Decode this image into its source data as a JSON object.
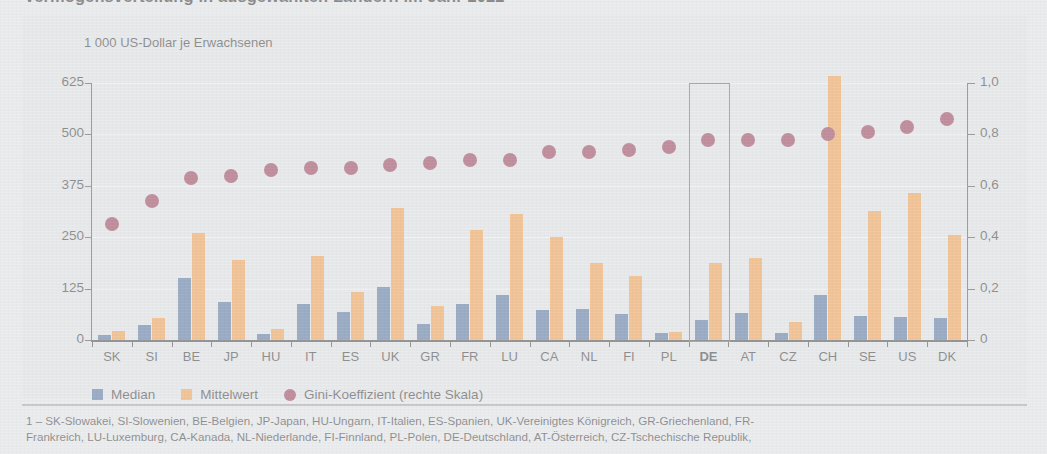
{
  "title": "Vermögensverteilung in ausgewählten Ländern im Jahr 2022",
  "axis_title": "1 000 US-Dollar je Erwachsenen",
  "legend": {
    "median_label": "Median",
    "mean_label": "Mittelwert",
    "gini_label": "Gini-Koeffizient (rechte Skala)"
  },
  "colors": {
    "median": "#3b5f94",
    "mean": "#f79431",
    "gini": "#8d1f3d",
    "highlight_box": "#54576b",
    "panel_background": "#e4e5e7",
    "page_background": "#e9eaec"
  },
  "highlight": {
    "country": "DE",
    "bold_label": true
  },
  "footnote": {
    "line1": "1 – SK-Slowakei, SI-Slowenien, BE-Belgien, JP-Japan, HU-Ungarn, IT-Italien, ES-Spanien, UK-Vereinigtes Königreich, GR-Griechenland, FR-",
    "line2": "Frankreich, LU-Luxemburg, CA-Kanada, NL-Niederlande, FI-Finnland, PL-Polen, DE-Deutschland, AT-Österreich, CZ-Tschechische Republik,"
  },
  "chart_data": {
    "type": "bar",
    "title": "Vermögensverteilung in ausgewählten Ländern im Jahr 2022",
    "xlabel": "",
    "ylabel": "1 000 US-Dollar je Erwachsenen",
    "ylabel_right": "Gini-Koeffizient",
    "ylim": [
      0,
      625
    ],
    "ylim_right": [
      0,
      1.0
    ],
    "yticks": [
      "0",
      "125",
      "250",
      "375",
      "500",
      "625"
    ],
    "ytick_values": [
      0,
      125,
      250,
      375,
      500,
      625
    ],
    "yticks_right": [
      "0",
      "0,2",
      "0,4",
      "0,6",
      "0,8",
      "1,0"
    ],
    "ytick_values_right": [
      0,
      0.2,
      0.4,
      0.6,
      0.8,
      1.0
    ],
    "grid": true,
    "legend_position": "below-axis-left",
    "categories": [
      "SK",
      "SI",
      "BE",
      "JP",
      "HU",
      "IT",
      "ES",
      "UK",
      "GR",
      "FR",
      "LU",
      "CA",
      "NL",
      "FI",
      "PL",
      "DE",
      "AT",
      "CZ",
      "CH",
      "SE",
      "US",
      "DK"
    ],
    "series": [
      {
        "name": "Median",
        "axis": "left",
        "values": [
          13,
          37,
          150,
          93,
          14,
          87,
          67,
          128,
          40,
          87,
          110,
          74,
          76,
          63,
          17,
          49,
          65,
          16,
          110,
          58,
          55,
          53
        ]
      },
      {
        "name": "Mittelwert",
        "axis": "left",
        "values": [
          21,
          54,
          261,
          195,
          28,
          205,
          117,
          322,
          83,
          268,
          306,
          250,
          187,
          155,
          20,
          188,
          200,
          43,
          642,
          314,
          358,
          256
        ]
      },
      {
        "name": "Gini-Koeffizient (rechte Skala)",
        "axis": "right",
        "values": [
          0.45,
          0.54,
          0.63,
          0.64,
          0.66,
          0.67,
          0.67,
          0.68,
          0.69,
          0.7,
          0.7,
          0.73,
          0.73,
          0.74,
          0.75,
          0.78,
          0.78,
          0.78,
          0.8,
          0.81,
          0.83,
          0.86
        ]
      }
    ]
  }
}
